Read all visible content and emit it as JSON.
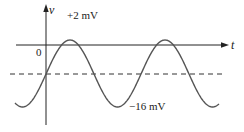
{
  "figure": {
    "type": "sinusoidal waveform diagram",
    "axes": {
      "vertical_label": "v",
      "horizontal_label": "t",
      "origin_label": "0"
    },
    "annotations": {
      "peak_label": "+2 mV",
      "trough_label": "−16 mV"
    },
    "dc_level_line": "dashed",
    "colors": {
      "axes": "#222222",
      "curve": "#555555",
      "dashed_line": "#333333"
    }
  },
  "chart_data": {
    "type": "line",
    "title": "",
    "xlabel": "t",
    "ylabel": "v",
    "series": [
      {
        "name": "v(t)",
        "description": "Sinusoid oscillating between +2 mV and -16 mV (DC offset -7 mV, amplitude 9 mV), about two full cycles shown",
        "max_mV": 2,
        "min_mV": -16,
        "dc_offset_mV": -7,
        "amplitude_mV": 9,
        "cycles_shown": 2.1
      }
    ],
    "reference_lines": [
      {
        "y_mV": 0,
        "style": "solid",
        "role": "t-axis"
      },
      {
        "y_mV": -7,
        "style": "dashed",
        "role": "average level"
      }
    ],
    "annotations": [
      "+2 mV",
      "−16 mV",
      "0"
    ],
    "grid": false,
    "legend": null
  },
  "geometry": {
    "v_axis_x": 46,
    "t_axis_y": 45,
    "dashed_y": 74,
    "center_y": 73.5,
    "amplitude_px": 33.5,
    "peak_x": 70,
    "period_px": 95,
    "curve_x_start": 15,
    "curve_x_end": 219
  }
}
